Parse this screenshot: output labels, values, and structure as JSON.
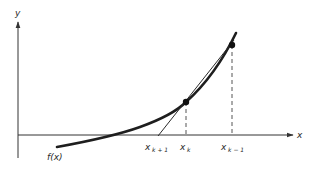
{
  "diagram": {
    "type": "secant-method-illustration",
    "colors": {
      "background": "#ffffff",
      "ink": "#222222",
      "axis": "#333333",
      "dashed": "#555555"
    },
    "axes": {
      "x_label": "x",
      "y_label": "y"
    },
    "curve": {
      "label": "f(x)"
    },
    "points": [
      {
        "name": "x_k",
        "label_base": "x",
        "label_sub": "k"
      },
      {
        "name": "x_k-1",
        "label_base": "x",
        "label_sub": "k − 1"
      }
    ],
    "secant_root": {
      "name": "x_k+1",
      "label_base": "x",
      "label_sub": "k + 1"
    }
  }
}
